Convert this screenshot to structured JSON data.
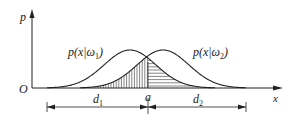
{
  "figure": {
    "axes": {
      "y_label": "p",
      "x_label": "x",
      "origin_label": "O"
    },
    "curves": [
      {
        "name": "class-1-density",
        "label_main": "p(x|ω",
        "label_sub": "1",
        "label_end": ")"
      },
      {
        "name": "class-2-density",
        "label_main": "p(x|ω",
        "label_sub": "2",
        "label_end": ")"
      }
    ],
    "threshold": {
      "label": "a"
    },
    "dimensions": [
      {
        "label_main": "d",
        "label_sub": "1"
      },
      {
        "label_main": "d",
        "label_sub": "2"
      }
    ],
    "colors": {
      "ink": "#222222",
      "background": "#ffffff"
    }
  }
}
